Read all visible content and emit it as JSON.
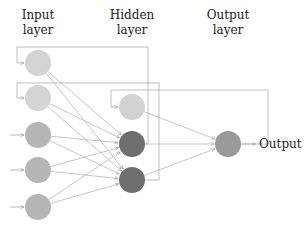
{
  "labels": {
    "input_layer": [
      "Input",
      "layer"
    ],
    "hidden_layer": [
      "Hidden",
      "layer"
    ],
    "output_layer": [
      "Output",
      "layer"
    ],
    "output": "Output"
  },
  "colors": {
    "input_light": "#d4d4d4",
    "input_mid": "#b5b5b5",
    "hidden_light": "#d2d2d2",
    "hidden_dark": "#6e6e6e",
    "output_node": "#9a9a9a",
    "edge": "#b0b0b0",
    "text": "#222222"
  },
  "nodes": {
    "input": [
      {
        "id": "i1",
        "x": 38,
        "y": 63,
        "shade": "light"
      },
      {
        "id": "i2",
        "x": 38,
        "y": 98,
        "shade": "light"
      },
      {
        "id": "i3",
        "x": 38,
        "y": 135,
        "shade": "mid"
      },
      {
        "id": "i4",
        "x": 38,
        "y": 170,
        "shade": "mid"
      },
      {
        "id": "i5",
        "x": 38,
        "y": 207,
        "shade": "mid"
      }
    ],
    "hidden": [
      {
        "id": "h1",
        "x": 132,
        "y": 107,
        "shade": "light"
      },
      {
        "id": "h2",
        "x": 132,
        "y": 144,
        "shade": "dark"
      },
      {
        "id": "h3",
        "x": 132,
        "y": 180,
        "shade": "dark"
      }
    ],
    "output": [
      {
        "id": "o1",
        "x": 228,
        "y": 144
      }
    ]
  },
  "recurrent_links": [
    {
      "from": "h2",
      "to": "i1"
    },
    {
      "from": "h3",
      "to": "i2"
    },
    {
      "from": "o1",
      "to": "h1"
    }
  ]
}
